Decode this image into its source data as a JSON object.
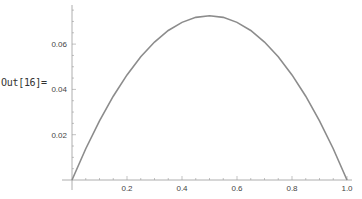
{
  "cell": {
    "label": "Out[16]="
  },
  "colors": {
    "curve": "#8c8c8c",
    "axis": "#9a9a9a",
    "text": "#444444"
  },
  "chart_data": {
    "type": "line",
    "title": "",
    "xlabel": "",
    "ylabel": "",
    "xlim": [
      0,
      1
    ],
    "ylim": [
      0,
      0.075
    ],
    "x_ticks": [
      "0.2",
      "0.4",
      "0.6",
      "0.8",
      "1.0"
    ],
    "y_ticks": [
      "0.02",
      "0.04",
      "0.06"
    ],
    "grid": false,
    "legend": null,
    "series": [
      {
        "name": "curve",
        "x": [
          0,
          0.05,
          0.1,
          0.15,
          0.2,
          0.25,
          0.3,
          0.35,
          0.4,
          0.45,
          0.5,
          0.55,
          0.6,
          0.65,
          0.7,
          0.75,
          0.8,
          0.85,
          0.9,
          0.95,
          1.0
        ],
        "y": [
          0,
          0.0138,
          0.0261,
          0.037,
          0.0464,
          0.0544,
          0.0609,
          0.066,
          0.0696,
          0.0718,
          0.0725,
          0.0718,
          0.0696,
          0.066,
          0.0609,
          0.0544,
          0.0464,
          0.037,
          0.0261,
          0.0138,
          0
        ]
      }
    ]
  }
}
